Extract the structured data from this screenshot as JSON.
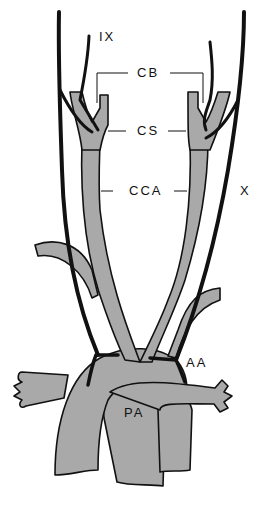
{
  "diagram": {
    "colors": {
      "vessel_fill": "#a9a9a9",
      "outline": "#111111",
      "background": "#ffffff"
    },
    "labels": {
      "ix": "IX",
      "cb": "CB",
      "cs": "CS",
      "cca": "CCA",
      "x": "X",
      "aa": "AA",
      "pa": "PA"
    }
  }
}
